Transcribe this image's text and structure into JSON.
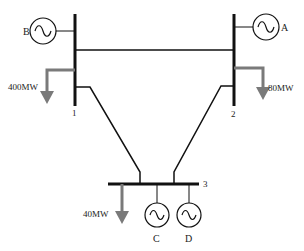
{
  "diagram": {
    "type": "three-bus power system one-line diagram",
    "colors": {
      "line": "#111111",
      "load": "#7a7a7a",
      "background": "#ffffff"
    },
    "buses": [
      {
        "id": "1",
        "label": "1"
      },
      {
        "id": "2",
        "label": "2"
      },
      {
        "id": "3",
        "label": "3"
      }
    ],
    "generators": [
      {
        "id": "A",
        "label": "A",
        "bus": "2"
      },
      {
        "id": "B",
        "label": "B",
        "bus": "1"
      },
      {
        "id": "C",
        "label": "C",
        "bus": "3"
      },
      {
        "id": "D",
        "label": "D",
        "bus": "3"
      }
    ],
    "loads": [
      {
        "bus": "1",
        "label": "400MW"
      },
      {
        "bus": "2",
        "label": "80MW"
      },
      {
        "bus": "3",
        "label": "40MW"
      }
    ],
    "lines": [
      {
        "from": "1",
        "to": "2"
      },
      {
        "from": "1",
        "to": "3"
      },
      {
        "from": "2",
        "to": "3"
      }
    ]
  }
}
